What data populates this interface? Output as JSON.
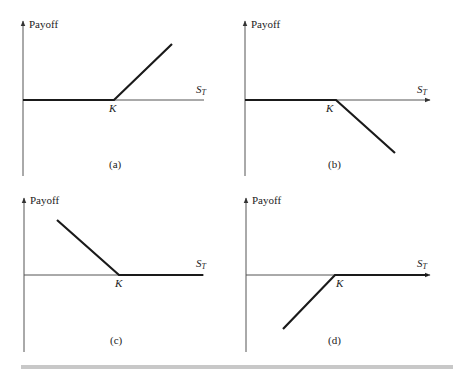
{
  "figure": {
    "panels": [
      {
        "id": "a",
        "caption": "(a)",
        "y_label": "Payoff",
        "x_label": "S",
        "x_sub": "T",
        "strike_label": "K",
        "shape": "long call"
      },
      {
        "id": "b",
        "caption": "(b)",
        "y_label": "Payoff",
        "x_label": "S",
        "x_sub": "T",
        "strike_label": "K",
        "shape": "short call"
      },
      {
        "id": "c",
        "caption": "(c)",
        "y_label": "Payoff",
        "x_label": "S",
        "x_sub": "T",
        "strike_label": "K",
        "shape": "long put"
      },
      {
        "id": "d",
        "caption": "(d)",
        "y_label": "Payoff",
        "x_label": "S",
        "x_sub": "T",
        "strike_label": "K",
        "shape": "short put"
      }
    ],
    "colors": {
      "line": "#1a1a1a",
      "axis": "#555555",
      "rule": "#c8c8c8"
    }
  }
}
